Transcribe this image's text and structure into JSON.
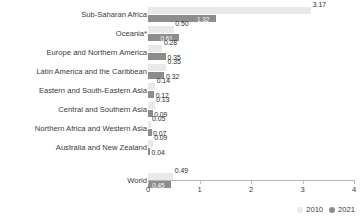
{
  "chart_data": {
    "type": "bar",
    "title": "",
    "xlabel": "",
    "ylabel": "",
    "xlim": [
      0,
      4
    ],
    "grid": false,
    "orientation": "horizontal",
    "legend_position": "bottom-right",
    "categories": [
      "Sub-Saharan Africa",
      "Oceania*",
      "Europe and Northern America",
      "Latin America and the Caribbean",
      "Eastern and South-Eastern Asia",
      "Central and Southern Asia",
      "Northern Africa and Western Asia",
      "Australia and New Zealand",
      "World"
    ],
    "series": [
      {
        "name": "2010",
        "color": "#e9e9e9",
        "values": [
          3.17,
          0.5,
          0.28,
          0.35,
          0.14,
          0.13,
          0.05,
          0.09,
          0.49
        ],
        "labels": [
          "3.17",
          "0.50",
          "0.28",
          "0.35",
          "0.14",
          "0.13",
          "0.05",
          "0.09",
          "0.49"
        ]
      },
      {
        "name": "2021",
        "color": "#8d8d8d",
        "values": [
          1.32,
          0.61,
          0.35,
          0.32,
          0.12,
          0.09,
          0.07,
          0.04,
          0.45
        ],
        "labels": [
          "1.32",
          "0.61",
          "0.35",
          "0.32",
          "0.12",
          "0.09",
          "0.07",
          "0.04",
          "0.45"
        ]
      }
    ],
    "xticks": [
      "0",
      "1",
      "2",
      "3",
      "4"
    ],
    "xtick_values": [
      0,
      1,
      2,
      3,
      4
    ]
  },
  "legend": {
    "items": [
      {
        "label": "2010",
        "color": "#e9e9e9"
      },
      {
        "label": "2021",
        "color": "#8d8d8d"
      }
    ]
  }
}
